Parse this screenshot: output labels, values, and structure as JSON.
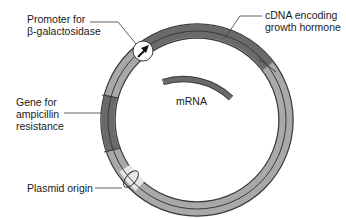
{
  "diagram": {
    "type": "plasmid-map",
    "labels": {
      "promoter": {
        "line1": "Promoter for",
        "line2": "β-galactosidase"
      },
      "cdna": {
        "line1": "cDNA encoding",
        "line2": "growth hormone"
      },
      "amp": {
        "line1": "Gene for",
        "line2": "ampicillin",
        "line3": "resistance"
      },
      "origin": {
        "line1": "Plasmid origin"
      },
      "mrna": {
        "line1": "mRNA"
      }
    },
    "colors": {
      "backbone": "#a9a9a9",
      "gene_dark": "#6a6a6a",
      "outline": "#3a3a3a",
      "origin_highlight": "#e8e8e8"
    }
  }
}
